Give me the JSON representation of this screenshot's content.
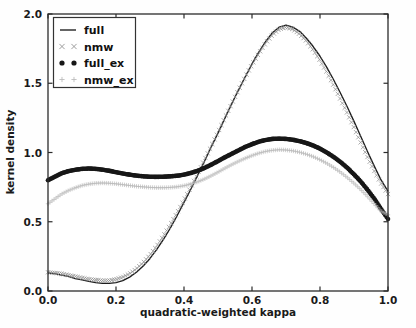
{
  "chart_data": {
    "type": "line",
    "title": "",
    "xlabel": "quadratic-weighted kappa",
    "ylabel": "kernel density",
    "xlim": [
      0.0,
      1.0
    ],
    "ylim": [
      0.0,
      2.0
    ],
    "xticks": [
      "0.0",
      "0.2",
      "0.4",
      "0.6",
      "0.8",
      "1.0"
    ],
    "xtick_values": [
      0.0,
      0.2,
      0.4,
      0.6,
      0.8,
      1.0
    ],
    "yticks": [
      "0.0",
      "0.5",
      "1.0",
      "1.5",
      "2.0"
    ],
    "ytick_values": [
      0.0,
      0.5,
      1.0,
      1.5,
      2.0
    ],
    "grid": false,
    "legend_position": "upper left",
    "legend_entries": [
      "full",
      "nmw",
      "full_ex",
      "nmw_ex"
    ],
    "x": [
      0.0,
      0.02,
      0.04,
      0.06,
      0.08,
      0.1,
      0.12,
      0.14,
      0.16,
      0.18,
      0.2,
      0.22,
      0.24,
      0.26,
      0.28,
      0.3,
      0.32,
      0.34,
      0.36,
      0.38,
      0.4,
      0.42,
      0.44,
      0.46,
      0.48,
      0.5,
      0.52,
      0.54,
      0.56,
      0.58,
      0.6,
      0.62,
      0.64,
      0.66,
      0.68,
      0.7,
      0.72,
      0.74,
      0.76,
      0.78,
      0.8,
      0.82,
      0.84,
      0.86,
      0.88,
      0.9,
      0.92,
      0.94,
      0.96,
      0.98,
      1.0
    ],
    "series": [
      {
        "name": "full",
        "style": "solid-line",
        "color": "#1c1c1c",
        "values": [
          0.13,
          0.125,
          0.115,
          0.105,
          0.09,
          0.08,
          0.07,
          0.06,
          0.055,
          0.055,
          0.06,
          0.075,
          0.1,
          0.135,
          0.18,
          0.235,
          0.3,
          0.375,
          0.455,
          0.545,
          0.64,
          0.735,
          0.835,
          0.935,
          1.04,
          1.14,
          1.245,
          1.35,
          1.45,
          1.545,
          1.64,
          1.725,
          1.8,
          1.865,
          1.905,
          1.92,
          1.905,
          1.875,
          1.825,
          1.765,
          1.695,
          1.615,
          1.525,
          1.43,
          1.33,
          1.225,
          1.115,
          1.005,
          0.9,
          0.8,
          0.72
        ]
      },
      {
        "name": "nmw",
        "style": "x-markers",
        "color": "#8d8d8d",
        "values": [
          0.135,
          0.13,
          0.125,
          0.115,
          0.105,
          0.095,
          0.085,
          0.08,
          0.075,
          0.075,
          0.085,
          0.1,
          0.125,
          0.16,
          0.205,
          0.26,
          0.325,
          0.4,
          0.48,
          0.565,
          0.655,
          0.75,
          0.845,
          0.945,
          1.045,
          1.145,
          1.25,
          1.35,
          1.45,
          1.545,
          1.635,
          1.715,
          1.79,
          1.85,
          1.89,
          1.905,
          1.89,
          1.855,
          1.805,
          1.74,
          1.665,
          1.58,
          1.485,
          1.385,
          1.285,
          1.18,
          1.07,
          0.965,
          0.865,
          0.775,
          0.7
        ]
      },
      {
        "name": "full_ex",
        "style": "dot-markers",
        "color": "#171717",
        "values": [
          0.8,
          0.825,
          0.85,
          0.865,
          0.875,
          0.882,
          0.884,
          0.882,
          0.876,
          0.868,
          0.858,
          0.848,
          0.84,
          0.833,
          0.828,
          0.825,
          0.824,
          0.825,
          0.828,
          0.832,
          0.84,
          0.852,
          0.868,
          0.888,
          0.912,
          0.938,
          0.965,
          0.99,
          1.015,
          1.04,
          1.06,
          1.078,
          1.09,
          1.098,
          1.1,
          1.098,
          1.092,
          1.082,
          1.068,
          1.05,
          1.028,
          1.0,
          0.968,
          0.932,
          0.89,
          0.842,
          0.79,
          0.73,
          0.665,
          0.59,
          0.52
        ]
      },
      {
        "name": "nmw_ex",
        "style": "plus-markers",
        "color": "#b9b9b9",
        "values": [
          0.63,
          0.665,
          0.7,
          0.725,
          0.745,
          0.762,
          0.772,
          0.778,
          0.78,
          0.778,
          0.774,
          0.768,
          0.762,
          0.756,
          0.752,
          0.748,
          0.746,
          0.746,
          0.748,
          0.752,
          0.76,
          0.772,
          0.788,
          0.808,
          0.832,
          0.858,
          0.886,
          0.912,
          0.936,
          0.958,
          0.978,
          0.995,
          1.008,
          1.016,
          1.02,
          1.018,
          1.012,
          1.002,
          0.988,
          0.97,
          0.948,
          0.922,
          0.892,
          0.858,
          0.82,
          0.778,
          0.732,
          0.682,
          0.628,
          0.575,
          0.55
        ]
      }
    ]
  },
  "axes": {
    "x_title": "quadratic-weighted kappa",
    "y_title": "kernel density"
  },
  "legend": {
    "items": [
      {
        "label": "full",
        "marker": "line"
      },
      {
        "label": "nmw",
        "marker": "cross"
      },
      {
        "label": "full_ex",
        "marker": "dot"
      },
      {
        "label": "nmw_ex",
        "marker": "plus"
      }
    ]
  },
  "colors": {
    "full": "#1c1c1c",
    "nmw": "#8d8d8d",
    "full_ex": "#171717",
    "nmw_ex": "#b9b9b9",
    "axis": "#2b2b2b",
    "background": "#ffffff"
  }
}
